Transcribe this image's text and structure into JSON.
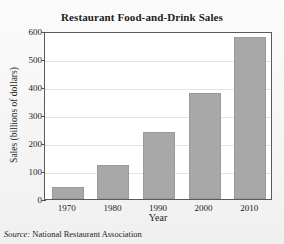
{
  "chart_data": {
    "type": "bar",
    "title": "Restaurant Food-and-Drink Sales",
    "xlabel": "Year",
    "ylabel": "Sales (billions of dollars)",
    "categories": [
      "1970",
      "1980",
      "1990",
      "2000",
      "2010"
    ],
    "values": [
      42,
      120,
      239,
      378,
      580
    ],
    "ylim": [
      0,
      600
    ],
    "yticks": [
      "0",
      "100",
      "200",
      "300",
      "400",
      "500",
      "600"
    ],
    "ytick_values": [
      0,
      100,
      200,
      300,
      400,
      500,
      600
    ],
    "grid": true,
    "legend": "none",
    "bar_color": "#a8a8a8",
    "frame_color": "#5a5a5a",
    "grid_color": "#e3e3e3",
    "background_color": "#f2f2f2",
    "plot_background_color": "#ffffff"
  },
  "footer": {
    "source_label": "Source:",
    "source_text": "National Restaurant Association"
  }
}
